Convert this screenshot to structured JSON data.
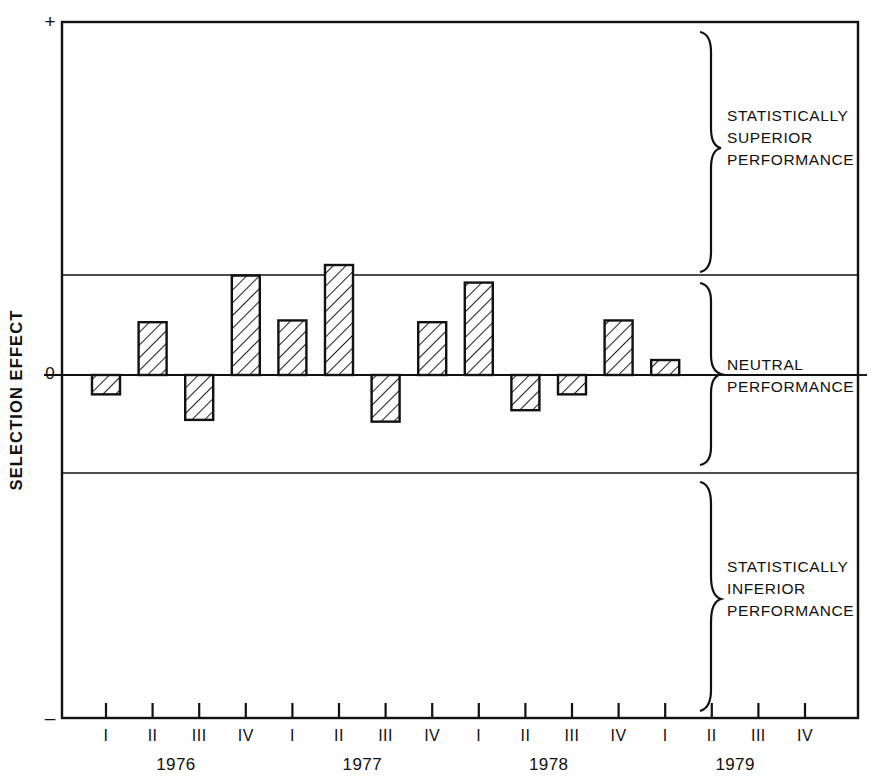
{
  "chart_data": {
    "type": "bar",
    "title": "",
    "xlabel": "",
    "ylabel": "SELECTION EFFECT",
    "categories": [
      "1976 I",
      "1976 II",
      "1976 III",
      "1976 IV",
      "1977 I",
      "1977 II",
      "1977 III",
      "1977 IV",
      "1978 I",
      "1978 II",
      "1978 III",
      "1978 IV",
      "1979 I",
      "1979 II",
      "1979 III",
      "1979 IV"
    ],
    "quarter_labels": [
      "I",
      "II",
      "III",
      "IV",
      "I",
      "II",
      "III",
      "IV",
      "I",
      "II",
      "III",
      "IV",
      "I",
      "II",
      "III",
      "IV"
    ],
    "years": [
      "1976",
      "1977",
      "1978",
      "1979"
    ],
    "values": [
      -0.22,
      0.6,
      -0.51,
      1.13,
      0.62,
      1.25,
      -0.53,
      0.6,
      1.05,
      -0.4,
      -0.22,
      0.62,
      0.17,
      null,
      null,
      null
    ],
    "bars_present": [
      true,
      true,
      true,
      true,
      true,
      true,
      true,
      true,
      true,
      true,
      true,
      true,
      true,
      false,
      false,
      false
    ],
    "ylim": [
      -3.0,
      3.0
    ],
    "y_axis_top_symbol": "+",
    "y_axis_zero_label": "0",
    "y_axis_bottom_symbol": "–",
    "grid": false,
    "legend_position": "right",
    "threshold_lines": [
      {
        "name": "upper-significance-line",
        "value": 0.87
      },
      {
        "name": "zero-line",
        "value": 0
      },
      {
        "name": "lower-significance-line",
        "value": -0.86
      }
    ],
    "bands": [
      {
        "name": "statistically-superior",
        "label_lines": [
          "STATISTICALLY",
          "SUPERIOR",
          "PERFORMANCE"
        ]
      },
      {
        "name": "neutral",
        "label_lines": [
          "NEUTRAL",
          "PERFORMANCE"
        ]
      },
      {
        "name": "statistically-inferior",
        "label_lines": [
          "STATISTICALLY",
          "INFERIOR",
          "PERFORMANCE"
        ]
      }
    ],
    "bar_style": {
      "fill": "#ffffff",
      "hatch": "diagonal",
      "stroke": "#111111"
    }
  },
  "colors": {
    "ink": "#111111",
    "paper": "#fefefe",
    "hatch": "#222222"
  }
}
